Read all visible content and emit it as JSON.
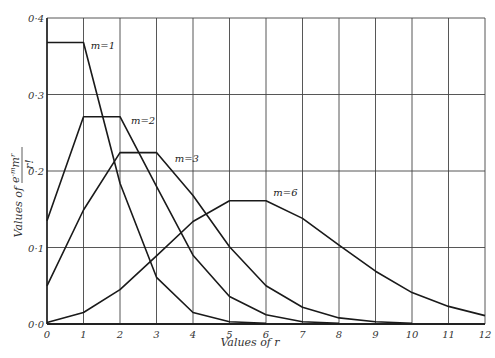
{
  "chart_data": {
    "type": "line",
    "title": "",
    "xlabel": "Values of r",
    "ylabel": "Values of e^-m m^r / r!",
    "ylabel_parts": {
      "prefix": "Values of",
      "num_e": "e",
      "num_exp": "-m",
      "num_m": "m",
      "num_rexp": "r",
      "den": "r!"
    },
    "xlim": [
      0,
      12
    ],
    "ylim": [
      0,
      0.4
    ],
    "x_ticks": [
      "0",
      "1",
      "2",
      "3",
      "4",
      "5",
      "6",
      "7",
      "8",
      "9",
      "10",
      "11",
      "12"
    ],
    "y_ticks": [
      "0·0",
      "0·1",
      "0·2",
      "0·3",
      "0·4"
    ],
    "grid": true,
    "series": [
      {
        "name": "m=1",
        "label": "m=1",
        "x": [
          0,
          1,
          2,
          3,
          4,
          5,
          6
        ],
        "values": [
          0.368,
          0.368,
          0.184,
          0.061,
          0.015,
          0.003,
          0.001
        ]
      },
      {
        "name": "m=2",
        "label": "m=2",
        "x": [
          0,
          1,
          2,
          3,
          4,
          5,
          6,
          7,
          8
        ],
        "values": [
          0.135,
          0.271,
          0.271,
          0.18,
          0.09,
          0.036,
          0.012,
          0.003,
          0.001
        ]
      },
      {
        "name": "m=3",
        "label": "m=3",
        "x": [
          0,
          1,
          2,
          3,
          4,
          5,
          6,
          7,
          8,
          9,
          10
        ],
        "values": [
          0.05,
          0.149,
          0.224,
          0.224,
          0.168,
          0.101,
          0.05,
          0.022,
          0.008,
          0.003,
          0.001
        ]
      },
      {
        "name": "m=6",
        "label": "m=6",
        "x": [
          0,
          1,
          2,
          3,
          4,
          5,
          6,
          7,
          8,
          9,
          10,
          11,
          12
        ],
        "values": [
          0.002,
          0.015,
          0.045,
          0.089,
          0.134,
          0.161,
          0.161,
          0.138,
          0.103,
          0.069,
          0.041,
          0.023,
          0.011
        ]
      }
    ],
    "annotations": [
      {
        "text": "m=1",
        "x": 1.2,
        "y": 0.36
      },
      {
        "text": "m=2",
        "x": 2.3,
        "y": 0.262
      },
      {
        "text": "m=3",
        "x": 3.5,
        "y": 0.212
      },
      {
        "text": "m=6",
        "x": 6.2,
        "y": 0.167
      }
    ]
  }
}
